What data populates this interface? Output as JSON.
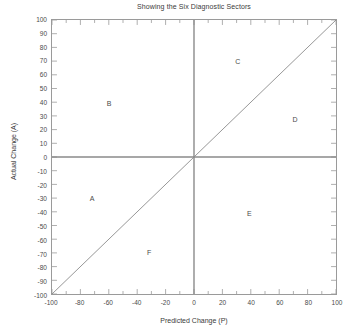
{
  "chart_data": {
    "type": "scatter",
    "title": "Showing the Six Diagnostic Sectors",
    "xlabel": "Predicted Change (P)",
    "ylabel": "Actual Change (A)",
    "xlim": [
      -100,
      100
    ],
    "ylim": [
      -100,
      100
    ],
    "grid": false,
    "legend": "none",
    "x_major_step": 20,
    "x_minor_step": 10,
    "y_major_step": 10,
    "xticks": [
      -100,
      -80,
      -60,
      -40,
      -20,
      0,
      20,
      40,
      60,
      80,
      100
    ],
    "xtick_labels": [
      "-100",
      "-80",
      "-60",
      "-40",
      "-20",
      "0",
      "20",
      "40",
      "60",
      "80",
      "100"
    ],
    "yticks": [
      -100,
      -90,
      -80,
      -70,
      -60,
      -50,
      -40,
      -30,
      -20,
      -10,
      0,
      10,
      20,
      30,
      40,
      50,
      60,
      70,
      80,
      90,
      100
    ],
    "ytick_labels": [
      "-100",
      "-90",
      "-80",
      "-70",
      "-60",
      "-50",
      "-40",
      "-30",
      "-20",
      "-10",
      "0",
      "10",
      "20",
      "30",
      "40",
      "50",
      "60",
      "70",
      "80",
      "90",
      "100"
    ],
    "reference_lines": [
      {
        "name": "identity-line",
        "type": "diagonal",
        "equation": "A = P",
        "from": [
          -100,
          -100
        ],
        "to": [
          100,
          100
        ],
        "color": "#8a8a8a"
      },
      {
        "name": "zero-horizontal-line",
        "type": "horizontal",
        "value": 0,
        "color": "#8a8a8a"
      },
      {
        "name": "zero-vertical-line",
        "type": "vertical",
        "value": 0,
        "color": "#8a8a8a"
      }
    ],
    "annotations": [
      {
        "label": "A",
        "x": -72,
        "y": -29
      },
      {
        "label": "B",
        "x": -60,
        "y": 40
      },
      {
        "label": "C",
        "x": 30,
        "y": 70
      },
      {
        "label": "D",
        "x": 70,
        "y": 28
      },
      {
        "label": "E",
        "x": 38,
        "y": -40
      },
      {
        "label": "F",
        "x": -32,
        "y": -68
      }
    ],
    "sector_count": 6
  },
  "colors": {
    "axis": "#9a9a9a",
    "reference_line": "#8a8a8a",
    "text": "#3a3a3a",
    "background": "#ffffff"
  }
}
